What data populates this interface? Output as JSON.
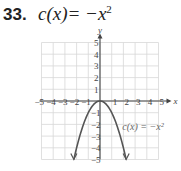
{
  "problem": {
    "number": "33.",
    "equation_left": "c(x)",
    "equation_right": "= −x",
    "equation_exp": "2"
  },
  "chart_data": {
    "type": "line",
    "title": "c(x) = −x²",
    "xlabel": "x",
    "ylabel": "y",
    "xlim": [
      -5,
      5
    ],
    "ylim": [
      -5,
      5
    ],
    "grid": true,
    "x_ticks": [
      "−5",
      "−4",
      "−3",
      "−2",
      "−1",
      "1",
      "2",
      "3",
      "4",
      "5"
    ],
    "y_ticks": [
      "5",
      "4",
      "3",
      "2",
      "1",
      "−1",
      "−2",
      "−3",
      "−4",
      "−5"
    ],
    "series": [
      {
        "name": "c(x) = −x²",
        "x": [
          -2.24,
          -2,
          -1.5,
          -1,
          -0.5,
          0,
          0.5,
          1,
          1.5,
          2,
          2.24
        ],
        "y": [
          -5,
          -4,
          -2.25,
          -1,
          -0.25,
          0,
          -0.25,
          -1,
          -2.25,
          -4,
          -5
        ]
      }
    ],
    "annotations": [
      {
        "text": "c(x) = −x²",
        "x": 1.9,
        "y": -2.5
      }
    ]
  }
}
